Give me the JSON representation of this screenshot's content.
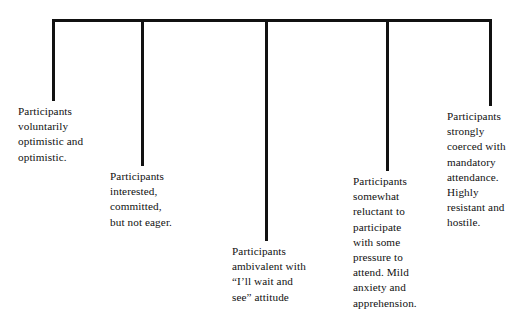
{
  "diagram": {
    "type": "horizontal-bracket-continuum",
    "title": "",
    "axis": {
      "name": "participant-motivation-continuum",
      "orientation": "horizontal",
      "bar": {
        "x_start": 52,
        "x_end": 492,
        "y": 19
      },
      "tick_count": 5
    },
    "points": [
      {
        "id": "point-1",
        "name": "voluntarily-optimistic",
        "tick_x": 52,
        "stem_bottom_y": 101,
        "label_x": 18,
        "label_y": 104,
        "label_width": 115,
        "text": "Participants\nvoluntarily\noptimistic and\noptimistic."
      },
      {
        "id": "point-2",
        "name": "interested-committed",
        "tick_x": 141,
        "stem_bottom_y": 166,
        "label_x": 110,
        "label_y": 169,
        "label_width": 120,
        "text": "Participants\ninterested,\ncommitted,\nbut not eager."
      },
      {
        "id": "point-3",
        "name": "ambivalent-wait-and-see",
        "tick_x": 265,
        "stem_bottom_y": 241,
        "label_x": 232,
        "label_y": 244,
        "label_width": 128,
        "text": "Participants\nambivalent with\n“I’ll wait and\nsee” attitude"
      },
      {
        "id": "point-4",
        "name": "somewhat-reluctant",
        "tick_x": 386,
        "stem_bottom_y": 171,
        "label_x": 353,
        "label_y": 174,
        "label_width": 92,
        "text": "Participants\nsomewhat\nreluctant to\nparticipate\nwith some\npressure to\nattend.  Mild\nanxiety and\napprehension."
      },
      {
        "id": "point-5",
        "name": "strongly-coerced",
        "tick_x": 489,
        "stem_bottom_y": 106,
        "label_x": 447,
        "label_y": 109,
        "label_width": 84,
        "text": "Participants\nstrongly\ncoerced with\nmandatory\nattendance.\nHighly\nresistant and\nhostile."
      }
    ],
    "colors": {
      "line": "#111111",
      "text": "#101010",
      "background": "#ffffff"
    }
  }
}
